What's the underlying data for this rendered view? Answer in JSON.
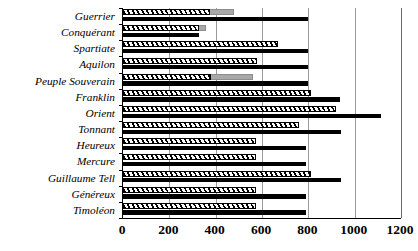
{
  "chart_data": {
    "type": "bar",
    "orientation": "horizontal",
    "title": "",
    "subtitle": "",
    "xlabel": "",
    "ylabel": "",
    "xlim": [
      0,
      1200
    ],
    "xticks": [
      0,
      200,
      400,
      600,
      800,
      1000,
      1200
    ],
    "xtick_labels": [
      "0",
      "200",
      "400",
      "600",
      "800",
      "1000",
      "1200"
    ],
    "grid": "vertical",
    "legend": "none",
    "categories": [
      "Guerrier",
      "Conquérant",
      "Spartiate",
      "Aquilon",
      "Peuple Souverain",
      "Franklin",
      "Orient",
      "Tonnant",
      "Heureux",
      "Mercure",
      "Guillaume Tell",
      "Généreux",
      "Timoléon"
    ],
    "series": [
      {
        "name": "hatched",
        "style": "diagonal-hatch",
        "values": [
          375,
          330,
          670,
          580,
          380,
          810,
          920,
          760,
          575,
          575,
          810,
          575,
          575
        ]
      },
      {
        "name": "gray",
        "style": "solid-gray",
        "values": [
          480,
          360,
          670,
          580,
          560,
          810,
          920,
          760,
          575,
          575,
          810,
          575,
          575
        ]
      },
      {
        "name": "black",
        "style": "solid-black",
        "values": [
          800,
          330,
          800,
          800,
          800,
          935,
          1115,
          940,
          790,
          790,
          940,
          790,
          790
        ]
      }
    ]
  },
  "colors": {
    "black": "#000000",
    "gray": "#a8a8a8",
    "grid": "#9a9a9a",
    "axis": "#000000",
    "background": "#ffffff"
  }
}
